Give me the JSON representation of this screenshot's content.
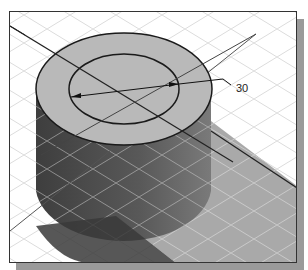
{
  "figure": {
    "type": "isometric 3D cylinder with dimension",
    "dimension": {
      "label": "30",
      "kind": "diameter"
    },
    "colors": {
      "background": "#ffffff",
      "grid": "#d8d8d8",
      "top_face": "#b8b8b8",
      "side_face_dark": "#4a4a4a",
      "side_face_mid": "#6a6a6a",
      "shadow": "#a8a8a8",
      "frame_shadow": "#9a9a9a",
      "edge": "#1a1a1a"
    }
  }
}
